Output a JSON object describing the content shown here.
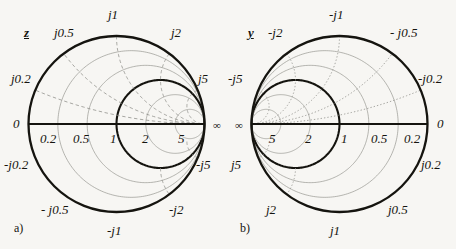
{
  "figure": {
    "background_color": "#f7f6f3",
    "ink_color": "#15140f",
    "grid_color": "#8d8d88",
    "width": 456,
    "height": 249
  },
  "chart_data": {
    "type": "smith-chart",
    "title": "",
    "panels": [
      {
        "id": "a",
        "caption": "a)",
        "symbol": "z",
        "symbol_meaning": "normalized impedance",
        "orientation": "open-circuit at left, short at right",
        "center": [
          116.5,
          124
        ],
        "radius": 88,
        "real_axis_labels": [
          {
            "text": "0",
            "value": 0,
            "x": 13,
            "y": 117
          },
          {
            "text": "0.2",
            "value": 0.2,
            "x": 40,
            "y": 132
          },
          {
            "text": "0.5",
            "value": 0.5,
            "x": 73,
            "y": 132
          },
          {
            "text": "1",
            "value": 1,
            "x": 110,
            "y": 132
          },
          {
            "text": "2",
            "value": 2,
            "x": 142,
            "y": 132
          },
          {
            "text": "5",
            "value": 5,
            "x": 178,
            "y": 132
          },
          {
            "text": "∞",
            "value": null,
            "x": 213,
            "y": 120
          }
        ],
        "reactance_labels": [
          {
            "text": "j1",
            "value": 1,
            "x": 108,
            "y": 8
          },
          {
            "text": "j0.5",
            "value": 0.5,
            "x": 54,
            "y": 26
          },
          {
            "text": "j2",
            "value": 2,
            "x": 171,
            "y": 26
          },
          {
            "text": "j0.2",
            "value": 0.2,
            "x": 11,
            "y": 72
          },
          {
            "text": "j5",
            "value": 5,
            "x": 198,
            "y": 72
          },
          {
            "text": "-j0.2",
            "value": -0.2,
            "x": 4,
            "y": 158
          },
          {
            "text": "-j5",
            "value": -5,
            "x": 196,
            "y": 158
          },
          {
            "text": "- j0.5",
            "value": -0.5,
            "x": 41,
            "y": 203
          },
          {
            "text": "-j2",
            "value": -2,
            "x": 169,
            "y": 203
          },
          {
            "text": "-j1",
            "value": -1,
            "x": 107,
            "y": 224
          }
        ],
        "resistance_circles": [
          0.2,
          0.5,
          1,
          2,
          5
        ],
        "reactance_arcs": [
          0.2,
          0.5,
          1,
          2,
          5,
          -0.2,
          -0.5,
          -1,
          -2,
          -5
        ],
        "bold_circles": [
          1
        ],
        "reactance_style": "dashed"
      },
      {
        "id": "b",
        "caption": "b)",
        "symbol": "y",
        "symbol_meaning": "normalized admittance",
        "orientation": "mirrored: short at left, open at right",
        "center": [
          339.5,
          124
        ],
        "radius": 88,
        "real_axis_labels": [
          {
            "text": "∞",
            "value": null,
            "x": 235,
            "y": 120
          },
          {
            "text": "5",
            "value": 5,
            "x": 269,
            "y": 132
          },
          {
            "text": "2",
            "value": 2,
            "x": 305,
            "y": 132
          },
          {
            "text": "1",
            "value": 1,
            "x": 341,
            "y": 132
          },
          {
            "text": "0.5",
            "value": 0.5,
            "x": 371,
            "y": 132
          },
          {
            "text": "0.2",
            "value": 0.2,
            "x": 404,
            "y": 132
          },
          {
            "text": "0",
            "value": 0,
            "x": 437,
            "y": 117
          }
        ],
        "reactance_labels": [
          {
            "text": "-j1",
            "value": -1,
            "x": 329,
            "y": 8
          },
          {
            "text": "-j2",
            "value": -2,
            "x": 268,
            "y": 26
          },
          {
            "text": "- j0.5",
            "value": -0.5,
            "x": 390,
            "y": 26
          },
          {
            "text": "-j5",
            "value": -5,
            "x": 228,
            "y": 72
          },
          {
            "text": "-j0.2",
            "value": -0.2,
            "x": 418,
            "y": 72
          },
          {
            "text": "j5",
            "value": 5,
            "x": 231,
            "y": 158
          },
          {
            "text": "j0.2",
            "value": 0.2,
            "x": 421,
            "y": 158
          },
          {
            "text": "j2",
            "value": 2,
            "x": 266,
            "y": 203
          },
          {
            "text": "j0.5",
            "value": 0.5,
            "x": 388,
            "y": 203
          },
          {
            "text": "j1",
            "value": 1,
            "x": 330,
            "y": 224
          }
        ],
        "resistance_circles": [
          0.2,
          0.5,
          1,
          2,
          5
        ],
        "reactance_arcs": [
          0.2,
          0.5,
          1,
          2,
          5,
          -0.2,
          -0.5,
          -1,
          -2,
          -5
        ],
        "bold_circles": [
          1
        ],
        "reactance_style": "dotted"
      }
    ]
  }
}
